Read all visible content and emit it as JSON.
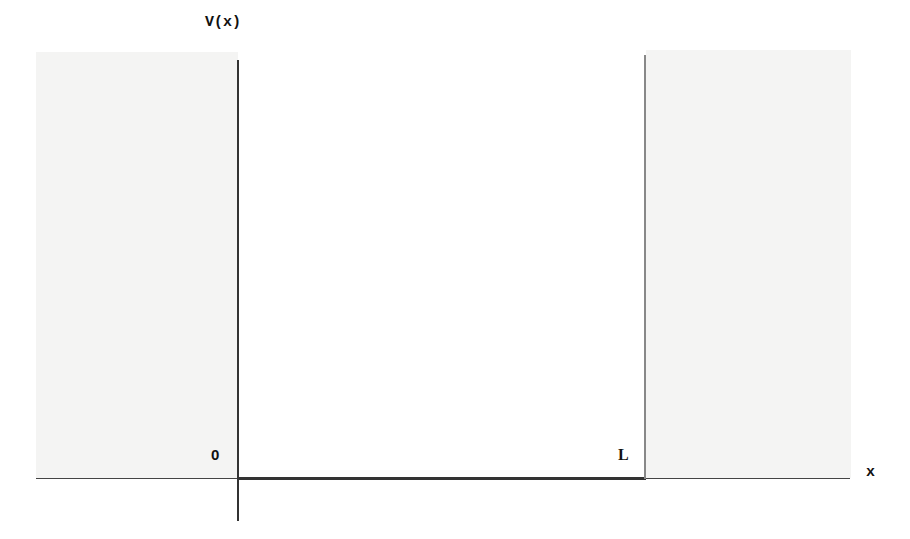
{
  "diagram": {
    "type": "potential-well",
    "labels": {
      "y_axis": "V(x)",
      "x_axis": "x",
      "origin": "0",
      "width": "L"
    },
    "geometry": {
      "well_left_x": 238,
      "well_right_x": 645,
      "well_bottom_y": 478,
      "y_axis_top": 60,
      "y_axis_bottom": 521,
      "x_axis_left": 36,
      "x_axis_right": 850
    },
    "colors": {
      "background": "#ffffff",
      "barrier_region": "#f4f4f3",
      "axis": "#333333",
      "right_wall": "#888888"
    }
  }
}
